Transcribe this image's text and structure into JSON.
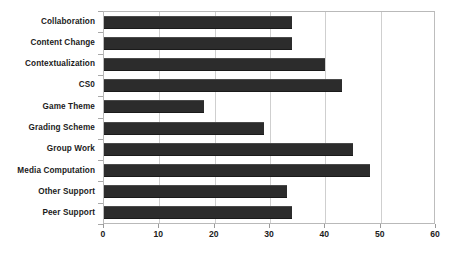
{
  "chart_data": {
    "type": "bar",
    "orientation": "horizontal",
    "title": "",
    "subtitle": "",
    "xlabel": "",
    "ylabel": "",
    "categories": [
      "Collaboration",
      "Content Change",
      "Contextualization",
      "CS0",
      "Game Theme",
      "Grading Scheme",
      "Group Work",
      "Media Computation",
      "Other Support",
      "Peer Support"
    ],
    "values": [
      34,
      34,
      40,
      43,
      18,
      29,
      45,
      48,
      33,
      34
    ],
    "xlim": [
      0,
      60
    ],
    "ylim": null,
    "xticks": [
      0,
      10,
      20,
      30,
      40,
      50,
      60
    ],
    "xtick_labels": [
      "0",
      "10",
      "20",
      "30",
      "40",
      "50",
      "60"
    ],
    "grid": "vertical",
    "legend": null,
    "legend_position": "none",
    "bar_color": "#2c2c2c",
    "gridline_color": "#cfcfcf",
    "axis_color": "#b9b9b9",
    "plot_background": "#ffffff",
    "annotations": []
  }
}
